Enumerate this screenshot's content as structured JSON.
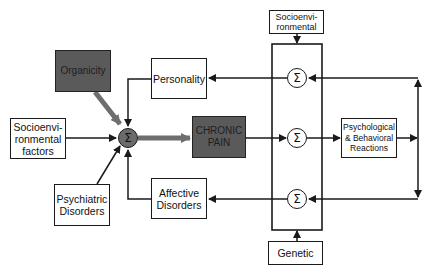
{
  "diagram": {
    "nodes": {
      "organicity": "Organicity",
      "personality": "Personality",
      "socioenv_factors": "Socioenvi-\nronmental\nfactors",
      "psychiatric": "Psychiatric\nDisorders",
      "affective": "Affective\nDisorders",
      "chronic_pain": "CHRONIC\nPAIN",
      "socioenv_top": "Socioenvi-\nronmental",
      "genetic": "Genetic",
      "psych_behav": "Psychological\n& Behavioral\nReactions"
    },
    "summation_symbol": "Σ",
    "colors": {
      "dark_box": "#5a5a5a",
      "line": "#1a1a1a",
      "thick_arrow": "#6e6e6e"
    }
  }
}
